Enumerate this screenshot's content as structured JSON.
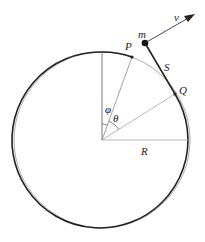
{
  "diagram": {
    "type": "geometry-physics",
    "labels": {
      "mass": "m",
      "velocity": "v",
      "point_p": "P",
      "point_q": "Q",
      "string_length": "S",
      "angle_phi": "φ",
      "angle_theta": "θ",
      "radius": "R"
    },
    "colors": {
      "stroke": "#222222",
      "thin_stroke": "#888888",
      "background": "#ffffff"
    }
  }
}
